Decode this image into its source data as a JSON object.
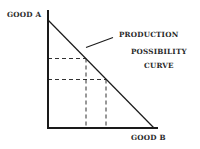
{
  "diagram": {
    "title": "Production Possibility Curve",
    "y_axis_label": "GOOD A",
    "x_axis_label": "GOOD B",
    "curve_label_lines": [
      "PRODUCTION",
      "POSSIBILITY",
      "CURVE"
    ],
    "colors": {
      "ink": "#1a1a1a",
      "background": "#ffffff"
    }
  }
}
